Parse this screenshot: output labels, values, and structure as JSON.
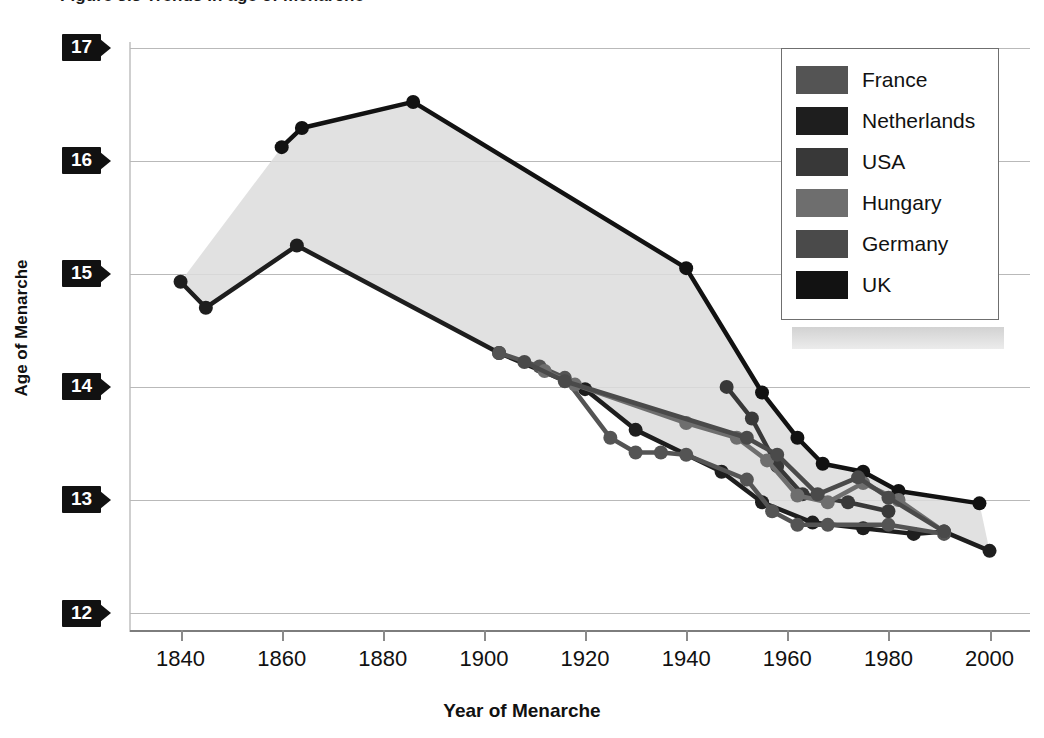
{
  "figure": {
    "caption": "Figure 3.3  Trends in age of menarche"
  },
  "axes": {
    "ylabel": "Age of Menarche",
    "xlabel": "Year of Menarche",
    "yticks": [
      "17",
      "16",
      "15",
      "14",
      "13",
      "12"
    ],
    "xticks": [
      "1840",
      "1860",
      "1880",
      "1900",
      "1920",
      "1940",
      "1960",
      "1980",
      "2000"
    ]
  },
  "legend": {
    "items": [
      {
        "label": "France",
        "color": "#545454"
      },
      {
        "label": "Netherlands",
        "color": "#1e1e1e"
      },
      {
        "label": "USA",
        "color": "#383838"
      },
      {
        "label": "Hungary",
        "color": "#6e6e6e"
      },
      {
        "label": "Germany",
        "color": "#4a4a4a"
      },
      {
        "label": "UK",
        "color": "#121212"
      }
    ]
  },
  "chart_data": {
    "type": "line",
    "title": "Figure 3.3  Trends in age of menarche",
    "xlabel": "Year of Menarche",
    "ylabel": "Age of Menarche",
    "xlim": [
      1830,
      2008
    ],
    "ylim": [
      11.85,
      17.05
    ],
    "xtick_values": [
      1840,
      1860,
      1880,
      1900,
      1920,
      1940,
      1960,
      1980,
      2000
    ],
    "ytick_values": [
      12,
      13,
      14,
      15,
      16,
      17
    ],
    "grid": "horizontal",
    "legend_position": "top-right",
    "shaded_band": {
      "description": "light gray band spanning the envelope between the earliest (UK) and earliest-low (Norway-like) series",
      "color": "#dcdcdc"
    },
    "series": [
      {
        "name": "UK",
        "color": "#121212",
        "points": [
          [
            1860,
            16.12
          ],
          [
            1864,
            16.29
          ],
          [
            1886,
            16.52
          ],
          [
            1940,
            15.05
          ],
          [
            1955,
            13.95
          ],
          [
            1962,
            13.55
          ],
          [
            1967,
            13.32
          ],
          [
            1975,
            13.25
          ],
          [
            1982,
            13.08
          ],
          [
            1998,
            12.97
          ]
        ]
      },
      {
        "name": "Netherlands",
        "color": "#1e1e1e",
        "points": [
          [
            1840,
            14.93
          ],
          [
            1845,
            14.7
          ],
          [
            1863,
            15.25
          ],
          [
            1903,
            14.3
          ],
          [
            1920,
            13.98
          ],
          [
            1930,
            13.62
          ],
          [
            1947,
            13.25
          ],
          [
            1955,
            12.98
          ],
          [
            1965,
            12.8
          ],
          [
            1975,
            12.75
          ],
          [
            1985,
            12.7
          ],
          [
            1991,
            12.72
          ],
          [
            2000,
            12.55
          ]
        ]
      },
      {
        "name": "France",
        "color": "#545454",
        "points": [
          [
            1903,
            14.3
          ],
          [
            1911,
            14.18
          ],
          [
            1916,
            14.08
          ],
          [
            1925,
            13.55
          ],
          [
            1930,
            13.42
          ],
          [
            1935,
            13.42
          ],
          [
            1940,
            13.4
          ],
          [
            1952,
            13.18
          ],
          [
            1957,
            12.9
          ],
          [
            1962,
            12.78
          ],
          [
            1968,
            12.78
          ],
          [
            1980,
            12.78
          ],
          [
            1991,
            12.7
          ]
        ]
      },
      {
        "name": "USA",
        "color": "#383838",
        "points": [
          [
            1948,
            14.0
          ],
          [
            1953,
            13.72
          ],
          [
            1958,
            13.3
          ],
          [
            1963,
            13.05
          ],
          [
            1972,
            12.98
          ],
          [
            1980,
            12.9
          ]
        ]
      },
      {
        "name": "Hungary",
        "color": "#6e6e6e",
        "points": [
          [
            1912,
            14.14
          ],
          [
            1918,
            14.02
          ],
          [
            1940,
            13.68
          ],
          [
            1950,
            13.55
          ],
          [
            1956,
            13.35
          ],
          [
            1962,
            13.04
          ],
          [
            1968,
            12.98
          ],
          [
            1975,
            13.15
          ],
          [
            1982,
            13.0
          ],
          [
            1991,
            12.72
          ]
        ]
      },
      {
        "name": "Germany",
        "color": "#4a4a4a",
        "points": [
          [
            1908,
            14.22
          ],
          [
            1916,
            14.05
          ],
          [
            1952,
            13.55
          ],
          [
            1958,
            13.4
          ],
          [
            1966,
            13.05
          ],
          [
            1974,
            13.2
          ],
          [
            1980,
            13.02
          ],
          [
            1991,
            12.72
          ]
        ]
      }
    ]
  }
}
